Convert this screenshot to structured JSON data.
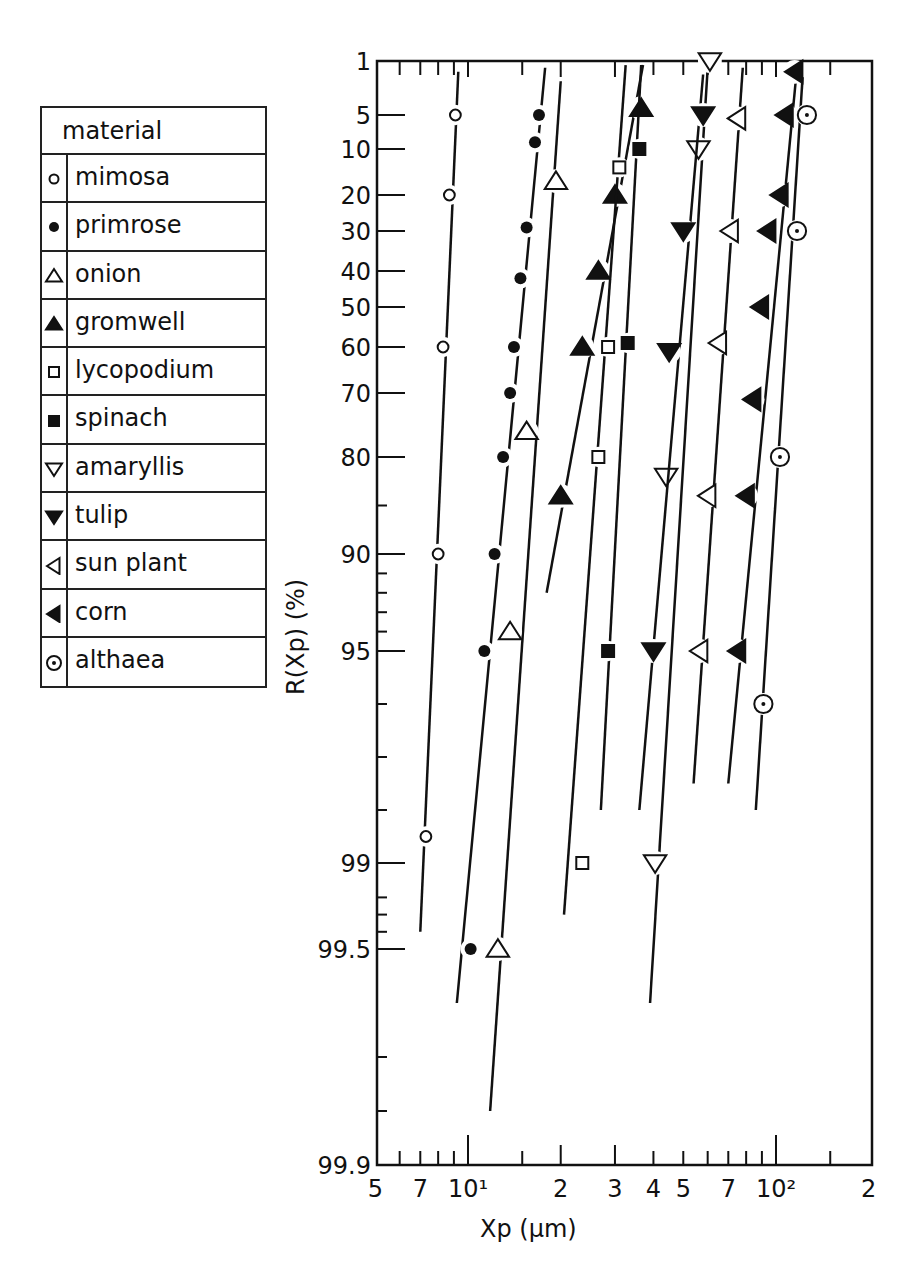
{
  "legend": {
    "title": "material",
    "items": [
      {
        "label": "mimosa",
        "symbol": "open-circle"
      },
      {
        "label": "primrose",
        "symbol": "filled-circle"
      },
      {
        "label": "onion",
        "symbol": "open-triangle-up"
      },
      {
        "label": "gromwell",
        "symbol": "filled-triangle-up"
      },
      {
        "label": "lycopodium",
        "symbol": "open-square"
      },
      {
        "label": "spinach",
        "symbol": "filled-square"
      },
      {
        "label": "amaryllis",
        "symbol": "open-triangle-down"
      },
      {
        "label": "tulip",
        "symbol": "filled-triangle-down"
      },
      {
        "label": "sun plant",
        "symbol": "open-triangle-left"
      },
      {
        "label": "corn",
        "symbol": "filled-triangle-left"
      },
      {
        "label": "althaea",
        "symbol": "dotted-circle"
      }
    ]
  },
  "axes": {
    "xlabel": "Xp  (μm)",
    "ylabel": "R(Xp)  (%)",
    "x_tick_labels": [
      "5",
      "7",
      "10¹",
      "2",
      "3",
      "4",
      "5",
      "7",
      "10²",
      "2"
    ],
    "y_tick_labels": [
      "1",
      "5",
      "10",
      "20",
      "30",
      "40",
      "50",
      "60",
      "70",
      "80",
      "90",
      "95",
      "99",
      "99.5",
      "99.9"
    ]
  },
  "chart_data": {
    "type": "scatter",
    "title": "",
    "xlabel": "Xp (μm)",
    "ylabel": "R(Xp) (%)",
    "xscale": "log",
    "yscale": "probability",
    "xlim": [
      5,
      200
    ],
    "ylim": [
      1,
      99.9
    ],
    "x_ticks": [
      5,
      7,
      10,
      20,
      30,
      40,
      50,
      70,
      100,
      200
    ],
    "y_ticks": [
      1,
      5,
      10,
      20,
      30,
      40,
      50,
      60,
      70,
      80,
      90,
      95,
      99,
      99.5,
      99.9
    ],
    "grid": false,
    "legend_position": "left-outside",
    "series": [
      {
        "name": "mimosa",
        "marker": "open-circle",
        "points": [
          [
            9.1,
            5
          ],
          [
            8.7,
            20
          ],
          [
            8.3,
            60
          ],
          [
            8.0,
            90
          ],
          [
            7.3,
            98.5
          ]
        ],
        "line": [
          [
            9.3,
            1.8
          ],
          [
            7.0,
            99.4
          ]
        ]
      },
      {
        "name": "primrose",
        "marker": "filled-circle",
        "points": [
          [
            17.0,
            5
          ],
          [
            16.5,
            9
          ],
          [
            15.5,
            29
          ],
          [
            14.8,
            42
          ],
          [
            14.1,
            60
          ],
          [
            13.7,
            70
          ],
          [
            13.0,
            80
          ],
          [
            12.2,
            90
          ],
          [
            11.3,
            95
          ],
          [
            10.2,
            99.5
          ]
        ],
        "line": [
          [
            17.8,
            1.5
          ],
          [
            9.2,
            99.6
          ]
        ]
      },
      {
        "name": "onion",
        "marker": "open-triangle-up",
        "points": [
          [
            19.3,
            17
          ],
          [
            15.5,
            76
          ],
          [
            13.7,
            94
          ],
          [
            12.5,
            99.5
          ]
        ],
        "line": [
          [
            20.0,
            2.5
          ],
          [
            11.8,
            99.8
          ]
        ]
      },
      {
        "name": "gromwell",
        "marker": "filled-triangle-up",
        "points": [
          [
            36.5,
            4.5
          ],
          [
            30.0,
            20
          ],
          [
            26.5,
            40
          ],
          [
            23.5,
            60
          ],
          [
            20.0,
            84
          ]
        ],
        "line": [
          [
            37.0,
            1.3
          ],
          [
            18.0,
            92
          ]
        ]
      },
      {
        "name": "lycopodium",
        "marker": "open-square",
        "points": [
          [
            31.0,
            14
          ],
          [
            28.5,
            60
          ],
          [
            26.5,
            80
          ],
          [
            23.5,
            99
          ]
        ],
        "line": [
          [
            32.5,
            1.3
          ],
          [
            20.5,
            99.3
          ]
        ]
      },
      {
        "name": "spinach",
        "marker": "filled-square",
        "points": [
          [
            36.0,
            10
          ],
          [
            33.0,
            59
          ],
          [
            28.5,
            95
          ]
        ],
        "line": [
          [
            36.5,
            1.3
          ],
          [
            27.0,
            98
          ]
        ]
      },
      {
        "name": "amaryllis",
        "marker": "open-triangle-down",
        "points": [
          [
            61.0,
            1
          ],
          [
            56.0,
            10
          ],
          [
            44.0,
            82
          ],
          [
            40.5,
            99
          ]
        ],
        "line": [
          [
            60.0,
            1.5
          ],
          [
            39.0,
            99.6
          ]
        ]
      },
      {
        "name": "tulip",
        "marker": "filled-triangle-down",
        "points": [
          [
            58.0,
            5
          ],
          [
            50.0,
            30
          ],
          [
            45.0,
            61
          ],
          [
            40.0,
            95
          ]
        ],
        "line": [
          [
            58.0,
            2
          ],
          [
            36.0,
            98
          ]
        ]
      },
      {
        "name": "sun plant",
        "marker": "open-triangle-left",
        "points": [
          [
            75.0,
            5.5
          ],
          [
            71.0,
            30
          ],
          [
            65.0,
            59
          ],
          [
            60.0,
            84
          ],
          [
            56.5,
            95
          ]
        ],
        "line": [
          [
            78.0,
            1.5
          ],
          [
            54.0,
            97.5
          ]
        ]
      },
      {
        "name": "corn",
        "marker": "filled-triangle-left",
        "points": [
          [
            115.0,
            1.8
          ],
          [
            107.0,
            5
          ],
          [
            103.0,
            20
          ],
          [
            94.0,
            30
          ],
          [
            89.0,
            50
          ],
          [
            84.0,
            71
          ],
          [
            80.0,
            84
          ],
          [
            75.0,
            95
          ]
        ],
        "line": [
          [
            117.0,
            1.5
          ],
          [
            70.0,
            97.5
          ]
        ]
      },
      {
        "name": "althaea",
        "marker": "dotted-circle",
        "points": [
          [
            126.0,
            5
          ],
          [
            117.0,
            30
          ],
          [
            103.0,
            80
          ],
          [
            91.0,
            96
          ]
        ],
        "line": [
          [
            122.0,
            2.2
          ],
          [
            86.0,
            98
          ]
        ]
      }
    ]
  }
}
